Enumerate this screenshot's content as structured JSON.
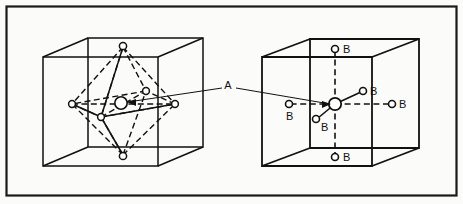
{
  "figure": {
    "frame_color": "#1a1a1a",
    "background_color": "#fbfbf9",
    "line_color": "#111111",
    "atom_fill": "#ffffff",
    "labels": {
      "a_site": "A",
      "b_site": "B"
    },
    "left_panel": {
      "name": "octahedron-in-cube",
      "caption_label": "A",
      "center_atom_label": "A",
      "vertex_count": 6
    },
    "right_panel": {
      "name": "octahedral-coordination-cube",
      "center_atom_label": "A",
      "b_labels": [
        "B",
        "B",
        "B",
        "B",
        "B",
        "B"
      ],
      "b_count": 6
    },
    "callout": {
      "label": "A",
      "x": 228,
      "y": 86
    }
  }
}
